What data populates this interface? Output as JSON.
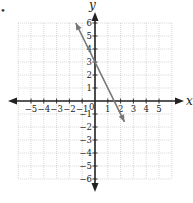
{
  "chart_data": {
    "type": "line",
    "title": "",
    "xlabel": "x",
    "ylabel": "y",
    "xlim": [
      -6,
      6
    ],
    "ylim": [
      -6,
      6
    ],
    "grid": true,
    "x_ticks": [
      "-5",
      "-4",
      "-3",
      "-2",
      "-1",
      "1",
      "2",
      "3",
      "4",
      "5"
    ],
    "y_ticks": [
      "6",
      "5",
      "4",
      "3",
      "2",
      "1",
      "-1",
      "-2",
      "-3",
      "-4",
      "-5",
      "-6"
    ],
    "origin_label": "0",
    "series": [
      {
        "name": "line",
        "equation": "y = -2x + 3",
        "slope": -2,
        "intercept": 3,
        "x": [
          -1.5,
          0,
          1.5,
          2.3
        ],
        "y": [
          6,
          3,
          0,
          -1.6
        ],
        "arrows": "both",
        "color": "#777777"
      }
    ]
  },
  "bullet": "•"
}
